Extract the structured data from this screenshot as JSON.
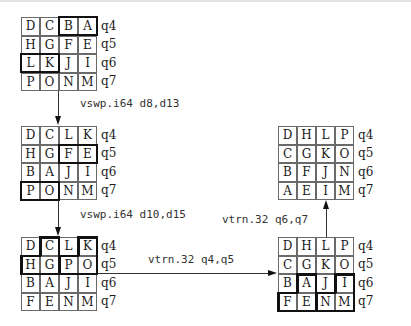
{
  "registers": [
    "q4",
    "q5",
    "q6",
    "q7"
  ],
  "grids": [
    {
      "id": "g1",
      "rows": [
        [
          "D",
          "C",
          "B",
          "A"
        ],
        [
          "H",
          "G",
          "F",
          "E"
        ],
        [
          "L",
          "K",
          "J",
          "I"
        ],
        [
          "P",
          "O",
          "N",
          "M"
        ]
      ]
    },
    {
      "id": "g2",
      "rows": [
        [
          "D",
          "C",
          "L",
          "K"
        ],
        [
          "H",
          "G",
          "F",
          "E"
        ],
        [
          "B",
          "A",
          "J",
          "I"
        ],
        [
          "P",
          "O",
          "N",
          "M"
        ]
      ]
    },
    {
      "id": "g3",
      "rows": [
        [
          "D",
          "C",
          "L",
          "K"
        ],
        [
          "H",
          "G",
          "P",
          "O"
        ],
        [
          "B",
          "A",
          "J",
          "I"
        ],
        [
          "F",
          "E",
          "N",
          "M"
        ]
      ]
    },
    {
      "id": "g4",
      "rows": [
        [
          "D",
          "H",
          "L",
          "P"
        ],
        [
          "C",
          "G",
          "K",
          "O"
        ],
        [
          "B",
          "A",
          "J",
          "I"
        ],
        [
          "F",
          "E",
          "N",
          "M"
        ]
      ]
    },
    {
      "id": "g5",
      "rows": [
        [
          "D",
          "H",
          "L",
          "P"
        ],
        [
          "C",
          "G",
          "K",
          "O"
        ],
        [
          "B",
          "F",
          "J",
          "N"
        ],
        [
          "A",
          "E",
          "I",
          "M"
        ]
      ]
    }
  ],
  "operations": {
    "op1": "vswp.i64 d8,d13",
    "op2": "vswp.i64 d10,d15",
    "op3": "vtrn.32 q4,q5",
    "op4": "vtrn.32 q6,q7"
  },
  "colors": {
    "line": "#6a6a6a",
    "highlight": "#111111",
    "background": "#ffffff"
  }
}
